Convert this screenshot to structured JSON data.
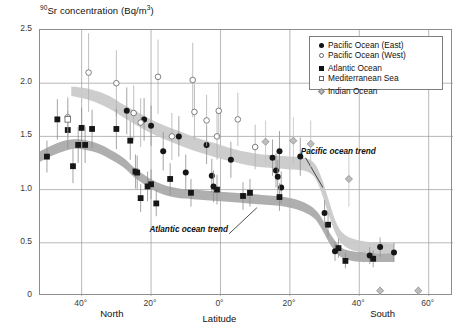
{
  "chart_data": {
    "type": "scatter",
    "title": "90Sr concentration (Bq/m3)",
    "title_prefix_sup": "90",
    "title_main": "Sr concentration (Bq/m",
    "title_suffix_sup": "3",
    "title_close": ")",
    "xlabel": "Latitude",
    "ylabel": "90Sr concentration (Bq/m3)",
    "ylim": [
      0,
      2.5
    ],
    "xlim": [
      52,
      -67
    ],
    "grid": true,
    "legend_position": "top-right",
    "yticks": [
      "0",
      "0.5",
      "1.0",
      "1.5",
      "2.0",
      "2.5"
    ],
    "ytick_values": [
      0,
      0.5,
      1.0,
      1.5,
      2.0,
      2.5
    ],
    "xticks": [
      "40°",
      "20°",
      "0°",
      "20°",
      "40°",
      "60°"
    ],
    "xtick_values": [
      40,
      20,
      0,
      -20,
      -40,
      -60
    ],
    "hemisphere_left": "North",
    "hemisphere_right": "South",
    "annotations": [
      {
        "text": "Pacific ocean trend",
        "x": -24,
        "y": 1.33
      },
      {
        "text": "Atlantic ocean trend",
        "x": -2,
        "y": 0.6
      }
    ],
    "legend": [
      {
        "label": "Pacific Ocean (East)",
        "marker": "filled-circle",
        "color": "#111111"
      },
      {
        "label": "Pacific Ocean (West)",
        "marker": "open-circle",
        "color": "#666666"
      },
      {
        "label": "Atlantic Ocean",
        "marker": "filled-square",
        "color": "#111111"
      },
      {
        "label": "Mediterranean Sea",
        "marker": "open-square",
        "color": "#666666"
      },
      {
        "label": "Indian Ocean",
        "marker": "gray-diamond",
        "color": "#b8b8b8"
      }
    ],
    "series": [
      {
        "name": "Pacific Ocean (East)",
        "marker": "filled-circle",
        "points": [
          {
            "x": 27,
            "y": 1.74,
            "err_lo": 0.22,
            "err_hi": 0.22
          },
          {
            "x": 22,
            "y": 1.66,
            "err_lo": 0.2,
            "err_hi": 0.2
          },
          {
            "x": 20,
            "y": 1.6,
            "err_lo": 0.19,
            "err_hi": 0.19
          },
          {
            "x": 16.5,
            "y": 1.36,
            "err_lo": 0.18,
            "err_hi": 0.18
          },
          {
            "x": 12,
            "y": 1.5,
            "err_lo": 0.19,
            "err_hi": 0.19
          },
          {
            "x": 10,
            "y": 1.16,
            "err_lo": 0.17,
            "err_hi": 0.17
          },
          {
            "x": 4,
            "y": 1.42,
            "err_lo": 0.18,
            "err_hi": 0.18
          },
          {
            "x": 2.5,
            "y": 1.13,
            "err_lo": 0.16,
            "err_hi": 0.16
          },
          {
            "x": 2,
            "y": 1.03,
            "err_lo": 0.15,
            "err_hi": 0.15
          },
          {
            "x": -3,
            "y": 1.28,
            "err_lo": 0.17,
            "err_hi": 0.17
          },
          {
            "x": -15,
            "y": 1.3,
            "err_lo": 0.17,
            "err_hi": 0.17
          },
          {
            "x": -16,
            "y": 1.18,
            "err_lo": 0.16,
            "err_hi": 0.16
          },
          {
            "x": -16.5,
            "y": 1.12,
            "err_lo": 0.16,
            "err_hi": 0.16
          },
          {
            "x": -17,
            "y": 1.36,
            "err_lo": 0.19,
            "err_hi": 0.19
          },
          {
            "x": -17.5,
            "y": 1.02,
            "err_lo": 0.15,
            "err_hi": 0.15
          },
          {
            "x": -23,
            "y": 1.31,
            "err_lo": 0.18,
            "err_hi": 0.18
          },
          {
            "x": -30,
            "y": 0.78,
            "err_lo": 0.12,
            "err_hi": 0.12
          },
          {
            "x": -33,
            "y": 0.42,
            "err_lo": 0.09,
            "err_hi": 0.09
          },
          {
            "x": -43,
            "y": 0.38,
            "err_lo": 0.08,
            "err_hi": 0.08
          },
          {
            "x": -46,
            "y": 0.46,
            "err_lo": 0.09,
            "err_hi": 0.09
          },
          {
            "x": -50,
            "y": 0.41,
            "err_lo": 0.09,
            "err_hi": 0.09
          }
        ]
      },
      {
        "name": "Pacific Ocean (West)",
        "marker": "open-circle",
        "points": [
          {
            "x": 44,
            "y": 1.68,
            "err_lo": 0.17,
            "err_hi": 0.17
          },
          {
            "x": 38,
            "y": 2.1,
            "err_lo": 0.37,
            "err_hi": 0.37
          },
          {
            "x": 30,
            "y": 2.0,
            "err_lo": 0.31,
            "err_hi": 0.31
          },
          {
            "x": 25,
            "y": 1.72,
            "err_lo": 0.26,
            "err_hi": 0.26
          },
          {
            "x": 23,
            "y": 1.63,
            "err_lo": 0.23,
            "err_hi": 0.23
          },
          {
            "x": 18,
            "y": 2.06,
            "err_lo": 0.35,
            "err_hi": 0.35
          },
          {
            "x": 14,
            "y": 1.5,
            "err_lo": 0.22,
            "err_hi": 0.22
          },
          {
            "x": 8,
            "y": 2.03,
            "err_lo": 0.35,
            "err_hi": 0.35
          },
          {
            "x": 7.5,
            "y": 1.73,
            "err_lo": 0.26,
            "err_hi": 0.26
          },
          {
            "x": 4,
            "y": 1.65,
            "err_lo": 0.24,
            "err_hi": 0.24
          },
          {
            "x": 1,
            "y": 1.5,
            "err_lo": 0.22,
            "err_hi": 0.22
          },
          {
            "x": 0.5,
            "y": 1.74,
            "err_lo": 0.27,
            "err_hi": 0.27
          },
          {
            "x": -5,
            "y": 1.66,
            "err_lo": 0.25,
            "err_hi": 0.25
          },
          {
            "x": -10,
            "y": 1.4,
            "err_lo": 0.21,
            "err_hi": 0.21
          }
        ]
      },
      {
        "name": "Atlantic Ocean",
        "marker": "filled-square",
        "points": [
          {
            "x": 50,
            "y": 1.31,
            "err_lo": 0.15,
            "err_hi": 0.15
          },
          {
            "x": 47,
            "y": 1.66,
            "err_lo": 0.19,
            "err_hi": 0.19
          },
          {
            "x": 44,
            "y": 1.56,
            "err_lo": 0.18,
            "err_hi": 0.18
          },
          {
            "x": 42.5,
            "y": 1.22,
            "err_lo": 0.16,
            "err_hi": 0.16
          },
          {
            "x": 41,
            "y": 1.42,
            "err_lo": 0.17,
            "err_hi": 0.17
          },
          {
            "x": 40,
            "y": 1.58,
            "err_lo": 0.19,
            "err_hi": 0.19
          },
          {
            "x": 39,
            "y": 1.42,
            "err_lo": 0.17,
            "err_hi": 0.17
          },
          {
            "x": 37,
            "y": 1.57,
            "err_lo": 0.18,
            "err_hi": 0.18
          },
          {
            "x": 30,
            "y": 1.57,
            "err_lo": 0.19,
            "err_hi": 0.19
          },
          {
            "x": 26,
            "y": 1.46,
            "err_lo": 0.18,
            "err_hi": 0.18
          },
          {
            "x": 24.5,
            "y": 1.17,
            "err_lo": 0.16,
            "err_hi": 0.16
          },
          {
            "x": 24,
            "y": 1.16,
            "err_lo": 0.16,
            "err_hi": 0.16
          },
          {
            "x": 23,
            "y": 0.92,
            "err_lo": 0.13,
            "err_hi": 0.13
          },
          {
            "x": 21,
            "y": 1.03,
            "err_lo": 0.14,
            "err_hi": 0.14
          },
          {
            "x": 20,
            "y": 1.05,
            "err_lo": 0.14,
            "err_hi": 0.14
          },
          {
            "x": 18.5,
            "y": 0.87,
            "err_lo": 0.12,
            "err_hi": 0.12
          },
          {
            "x": 14.5,
            "y": 1.1,
            "err_lo": 0.15,
            "err_hi": 0.15
          },
          {
            "x": 8.5,
            "y": 0.97,
            "err_lo": 0.13,
            "err_hi": 0.13
          },
          {
            "x": 1,
            "y": 1.0,
            "err_lo": 0.14,
            "err_hi": 0.14
          },
          {
            "x": -6.5,
            "y": 0.94,
            "err_lo": 0.13,
            "err_hi": 0.13
          },
          {
            "x": -8.5,
            "y": 0.97,
            "err_lo": 0.13,
            "err_hi": 0.13
          },
          {
            "x": -17,
            "y": 0.93,
            "err_lo": 0.13,
            "err_hi": 0.13
          },
          {
            "x": -31,
            "y": 0.67,
            "err_lo": 0.11,
            "err_hi": 0.11
          },
          {
            "x": -34,
            "y": 0.45,
            "err_lo": 0.09,
            "err_hi": 0.09
          },
          {
            "x": -36,
            "y": 0.33,
            "err_lo": 0.07,
            "err_hi": 0.07
          },
          {
            "x": -44,
            "y": 0.35,
            "err_lo": 0.08,
            "err_hi": 0.08
          }
        ]
      },
      {
        "name": "Mediterranean Sea",
        "marker": "open-square",
        "points": [
          {
            "x": 44,
            "y": 1.66,
            "err_lo": 0.21,
            "err_hi": 0.21
          }
        ]
      },
      {
        "name": "Indian Ocean",
        "marker": "gray-diamond",
        "points": [
          {
            "x": -13,
            "y": 1.45,
            "err_lo": 0.2,
            "err_hi": 0.2
          },
          {
            "x": -21,
            "y": 1.46,
            "err_lo": 0.22,
            "err_hi": 0.22
          },
          {
            "x": -26,
            "y": 1.43,
            "err_lo": 0.22,
            "err_hi": 0.22
          },
          {
            "x": -37,
            "y": 1.1,
            "err_lo": 0.26,
            "err_hi": 0.26
          },
          {
            "x": -46,
            "y": 0.05,
            "err_lo": 0.04,
            "err_hi": 0.04
          },
          {
            "x": -57,
            "y": 0.05,
            "err_lo": 0.04,
            "err_hi": 0.04
          }
        ]
      }
    ],
    "trend_bands": [
      {
        "name": "Pacific ocean trend",
        "fill": "#c9c9c9",
        "upper": [
          [
            43,
            1.97
          ],
          [
            40,
            1.96
          ],
          [
            36,
            1.93
          ],
          [
            32,
            1.88
          ],
          [
            28,
            1.8
          ],
          [
            24,
            1.73
          ],
          [
            20,
            1.66
          ],
          [
            16,
            1.6
          ],
          [
            12,
            1.55
          ],
          [
            8,
            1.5
          ],
          [
            4,
            1.46
          ],
          [
            0,
            1.42
          ],
          [
            -4,
            1.38
          ],
          [
            -8,
            1.35
          ],
          [
            -12,
            1.33
          ],
          [
            -16,
            1.32
          ],
          [
            -20,
            1.31
          ],
          [
            -24,
            1.3
          ],
          [
            -27,
            1.25
          ],
          [
            -29,
            1.12
          ],
          [
            -31,
            0.92
          ],
          [
            -33,
            0.72
          ],
          [
            -35,
            0.6
          ],
          [
            -38,
            0.54
          ],
          [
            -42,
            0.51
          ],
          [
            -46,
            0.5
          ],
          [
            -50,
            0.49
          ]
        ],
        "lower": [
          [
            43,
            1.88
          ],
          [
            40,
            1.86
          ],
          [
            36,
            1.82
          ],
          [
            32,
            1.76
          ],
          [
            28,
            1.68
          ],
          [
            24,
            1.6
          ],
          [
            20,
            1.53
          ],
          [
            16,
            1.47
          ],
          [
            12,
            1.42
          ],
          [
            8,
            1.37
          ],
          [
            4,
            1.33
          ],
          [
            0,
            1.29
          ],
          [
            -4,
            1.26
          ],
          [
            -8,
            1.23
          ],
          [
            -12,
            1.21
          ],
          [
            -16,
            1.2
          ],
          [
            -20,
            1.19
          ],
          [
            -24,
            1.18
          ],
          [
            -27,
            1.12
          ],
          [
            -29,
            0.98
          ],
          [
            -31,
            0.78
          ],
          [
            -33,
            0.6
          ],
          [
            -35,
            0.49
          ],
          [
            -38,
            0.43
          ],
          [
            -42,
            0.41
          ],
          [
            -46,
            0.4
          ],
          [
            -50,
            0.39
          ]
        ]
      },
      {
        "name": "Atlantic ocean trend",
        "fill": "#a8a8a8",
        "upper": [
          [
            52,
            1.36
          ],
          [
            49,
            1.41
          ],
          [
            46,
            1.45
          ],
          [
            43,
            1.47
          ],
          [
            40,
            1.47
          ],
          [
            36,
            1.44
          ],
          [
            32,
            1.38
          ],
          [
            28,
            1.3
          ],
          [
            25,
            1.21
          ],
          [
            22,
            1.14
          ],
          [
            19,
            1.08
          ],
          [
            16,
            1.04
          ],
          [
            12,
            1.01
          ],
          [
            8,
            1.0
          ],
          [
            4,
            0.99
          ],
          [
            0,
            0.98
          ],
          [
            -4,
            0.97
          ],
          [
            -8,
            0.96
          ],
          [
            -12,
            0.95
          ],
          [
            -16,
            0.94
          ],
          [
            -20,
            0.92
          ],
          [
            -24,
            0.88
          ],
          [
            -27,
            0.82
          ],
          [
            -29,
            0.74
          ],
          [
            -31,
            0.62
          ],
          [
            -33,
            0.52
          ],
          [
            -35,
            0.45
          ],
          [
            -38,
            0.42
          ],
          [
            -42,
            0.41
          ],
          [
            -46,
            0.4
          ],
          [
            -50,
            0.4
          ]
        ],
        "lower": [
          [
            52,
            1.26
          ],
          [
            49,
            1.31
          ],
          [
            46,
            1.35
          ],
          [
            43,
            1.38
          ],
          [
            40,
            1.38
          ],
          [
            36,
            1.35
          ],
          [
            32,
            1.29
          ],
          [
            28,
            1.21
          ],
          [
            25,
            1.12
          ],
          [
            22,
            1.05
          ],
          [
            19,
            0.99
          ],
          [
            16,
            0.95
          ],
          [
            12,
            0.92
          ],
          [
            8,
            0.91
          ],
          [
            4,
            0.9
          ],
          [
            0,
            0.89
          ],
          [
            -4,
            0.88
          ],
          [
            -8,
            0.87
          ],
          [
            -12,
            0.86
          ],
          [
            -16,
            0.85
          ],
          [
            -20,
            0.83
          ],
          [
            -24,
            0.79
          ],
          [
            -27,
            0.73
          ],
          [
            -29,
            0.64
          ],
          [
            -31,
            0.52
          ],
          [
            -33,
            0.42
          ],
          [
            -35,
            0.36
          ],
          [
            -38,
            0.33
          ],
          [
            -42,
            0.32
          ],
          [
            -46,
            0.32
          ],
          [
            -50,
            0.32
          ]
        ]
      }
    ],
    "leader_lines": [
      {
        "from": [
          -24.5,
          1.3
        ],
        "to": [
          -29.5,
          1.02
        ],
        "name": "pacific-leader"
      },
      {
        "from": [
          -2.5,
          0.585
        ],
        "to": [
          -10.5,
          0.83
        ],
        "name": "atlantic-leader"
      }
    ]
  }
}
